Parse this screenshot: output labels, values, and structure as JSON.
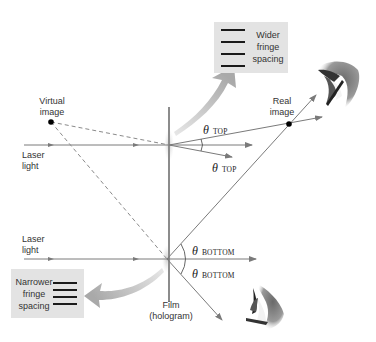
{
  "diagram": {
    "labels": {
      "virtual_image": [
        "Virtual",
        "image"
      ],
      "real_image": [
        "Real",
        "image"
      ],
      "laser_top": [
        "Laser",
        "light"
      ],
      "laser_bottom": [
        "Laser",
        "light"
      ],
      "film": [
        "Film",
        "(hologram)"
      ]
    },
    "angles": {
      "top_upper": {
        "symbol": "θ",
        "subscript": "TOP"
      },
      "top_lower": {
        "symbol": "θ",
        "subscript": "TOP"
      },
      "bottom_upper": {
        "symbol": "θ",
        "subscript": "BOTTOM"
      },
      "bottom_lower": {
        "symbol": "θ",
        "subscript": "BOTTOM"
      }
    },
    "callouts": {
      "wider": {
        "lines": [
          "Wider",
          "fringe",
          "spacing"
        ],
        "fringe_count": 4
      },
      "narrower": {
        "lines": [
          "Narrower",
          "fringe",
          "spacing"
        ],
        "fringe_count": 4
      }
    },
    "icons": [
      "eye-upper-right",
      "eye-lower-right"
    ],
    "colors": {
      "ray": "#7a7a7a",
      "dashed_ray": "#8a8a8a",
      "film": "#8c8c8c",
      "callout_bg": "#e3e3e3",
      "arrow_fill": "#b8b8b8",
      "dot": "#000000"
    }
  }
}
